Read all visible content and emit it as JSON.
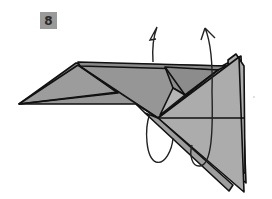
{
  "step": {
    "number": "8"
  },
  "diagram": {
    "instructions": "rotate/turn model over (two curved rotation arrows)",
    "colors": {
      "paper_dark": "#8e8e8e",
      "paper_mid": "#a3a3a3",
      "paper_light": "#b4b4b4",
      "line": "#111111",
      "badge": "#9a9a9a"
    }
  }
}
